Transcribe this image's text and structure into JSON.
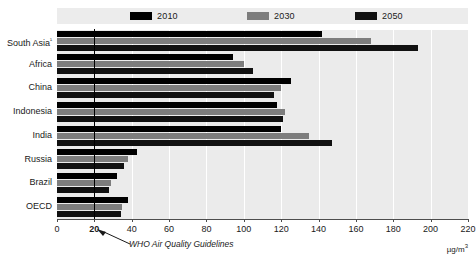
{
  "chart_data": {
    "type": "bar",
    "orientation": "horizontal",
    "title": "",
    "xlabel": "µg/m³",
    "ylabel": "",
    "categories": [
      "South Asia¹",
      "Africa",
      "China",
      "Indonesia",
      "India",
      "Russia",
      "Brazil",
      "OECD"
    ],
    "series": [
      {
        "name": "2010",
        "color": "#000000",
        "values": [
          142,
          94,
          125,
          118,
          120,
          43,
          32,
          38
        ]
      },
      {
        "name": "2030",
        "color": "#7d7d7d",
        "values": [
          168,
          100,
          120,
          122,
          135,
          38,
          29,
          35
        ]
      },
      {
        "name": "2050",
        "color": "#111111",
        "values": [
          193,
          105,
          116,
          121,
          147,
          36,
          28,
          34
        ]
      }
    ],
    "xlim": [
      0,
      220
    ],
    "xticks": [
      0,
      20,
      40,
      60,
      80,
      100,
      120,
      140,
      160,
      180,
      200,
      220
    ],
    "xtick_labels": [
      "0",
      "20",
      "40",
      "60",
      "80",
      "100",
      "120",
      "140",
      "160",
      "180",
      "200",
      "220"
    ],
    "highlight_tick": "20",
    "grid": "vertical",
    "legend_position": "top",
    "reference_line": {
      "value": 20,
      "label": "WHO Air Quality Guidelines",
      "color": "#000000"
    },
    "annotations": [
      {
        "text": "WHO Air Quality Guidelines",
        "kind": "reference-line-callout"
      }
    ]
  },
  "legend": {
    "items": [
      {
        "label": "2010",
        "color": "#000000"
      },
      {
        "label": "2030",
        "color": "#7d7d7d"
      },
      {
        "label": "2050",
        "color": "#111111"
      }
    ]
  },
  "axes": {
    "unit_label": "µg/m",
    "unit_exponent": "3"
  },
  "colors": {
    "plot_background": "#ebebeb",
    "legend_background": "#ececec",
    "gridline": "#ffffff",
    "axis": "#4d4d4d",
    "text": "#1a1a1a",
    "reference_line": "#000000"
  }
}
